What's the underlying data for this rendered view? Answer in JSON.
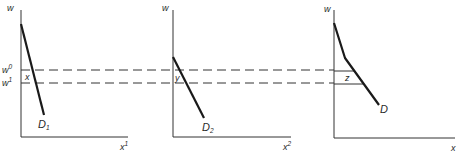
{
  "diagram": {
    "shared": {
      "wage_high_label": "w",
      "wage_high_sup": "0",
      "wage_low_label": "w",
      "wage_low_sup": "1"
    },
    "panels": [
      {
        "y_axis_label": "w",
        "x_axis_label": "x",
        "x_axis_sup": "1",
        "curve_label": "D",
        "curve_sub": "1",
        "interval_label": "x"
      },
      {
        "y_axis_label": "w",
        "x_axis_label": "x",
        "x_axis_sup": "2",
        "curve_label": "D",
        "curve_sub": "2",
        "interval_label": "y"
      },
      {
        "y_axis_label": "w",
        "x_axis_label": "x",
        "x_axis_sup": "",
        "curve_label": "D",
        "curve_sub": "",
        "interval_label": "z"
      }
    ]
  }
}
